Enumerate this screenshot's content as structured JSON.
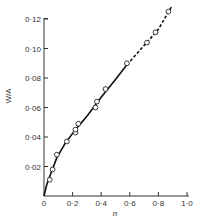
{
  "chart_data": {
    "type": "line",
    "title": "",
    "xlabel": "n",
    "ylabel": "W/A",
    "xlim": [
      0,
      1.0
    ],
    "ylim": [
      0,
      0.12
    ],
    "grid": false,
    "legend": null,
    "x_ticks": [
      "0",
      "0·2",
      "0·4",
      "0·6",
      "0·8",
      "1·0"
    ],
    "x_tick_values": [
      0,
      0.2,
      0.4,
      0.6,
      0.8,
      1.0
    ],
    "y_ticks": [
      "0·02",
      "0·04",
      "0·06",
      "0·08",
      "0·10",
      "0·12"
    ],
    "y_tick_values": [
      0.02,
      0.04,
      0.06,
      0.08,
      0.1,
      0.12
    ],
    "series": [
      {
        "name": "measured points",
        "style": "open-circle",
        "x": [
          0.04,
          0.06,
          0.09,
          0.16,
          0.22,
          0.22,
          0.24,
          0.36,
          0.37,
          0.43,
          0.58,
          0.72,
          0.78,
          0.87
        ],
        "y": [
          0.011,
          0.018,
          0.028,
          0.037,
          0.043,
          0.045,
          0.049,
          0.06,
          0.064,
          0.0725,
          0.09,
          0.104,
          0.111,
          0.125
        ]
      },
      {
        "name": "fitted curve (solid)",
        "style": "solid",
        "x": [
          0,
          0.02,
          0.05,
          0.09,
          0.15,
          0.22,
          0.3,
          0.4,
          0.5,
          0.58
        ],
        "y": [
          0,
          0.008,
          0.016,
          0.026,
          0.036,
          0.045,
          0.054,
          0.067,
          0.079,
          0.089
        ]
      },
      {
        "name": "extrapolated curve (dashed)",
        "style": "dashed",
        "x": [
          0.58,
          0.7,
          0.8,
          0.89
        ],
        "y": [
          0.089,
          0.102,
          0.113,
          0.128
        ]
      }
    ]
  }
}
